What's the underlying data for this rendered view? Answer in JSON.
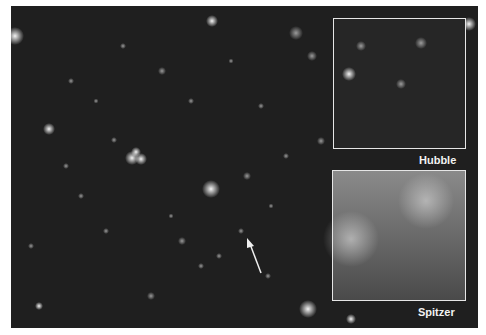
{
  "figure": {
    "insets": [
      {
        "id": "hubble",
        "label": "Hubble"
      },
      {
        "id": "spitzer",
        "label": "Spitzer"
      }
    ],
    "colors": {
      "background": "#1e1e1e",
      "frame": "#e6e6e6",
      "label": "#f2f2f2"
    }
  }
}
